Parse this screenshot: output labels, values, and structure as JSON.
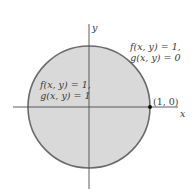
{
  "diagram": {
    "type": "unit-disk-region",
    "colors": {
      "disk_fill": "#d9d9d9",
      "disk_stroke": "#6a6a6a",
      "axis": "#4a4a4a",
      "text": "#3a3a3a",
      "point": "#111111",
      "background": "#ffffff"
    },
    "axes": {
      "x_label": "x",
      "y_label": "y"
    },
    "point": {
      "label": "(1, 0)"
    },
    "region_inside": {
      "line1": "f(x, y) = 1,",
      "line2": "g(x, y) = 1"
    },
    "region_outside": {
      "line1": "f(x, y) = 1,",
      "line2": "g(x, y) = 0"
    }
  }
}
